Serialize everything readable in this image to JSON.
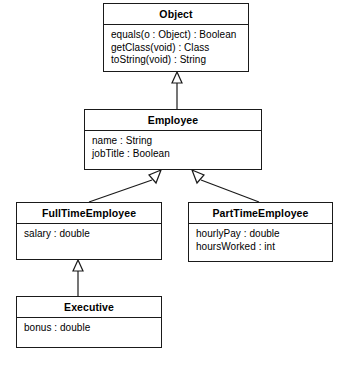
{
  "diagram": {
    "type": "uml-class-diagram",
    "background_color": "#ffffff",
    "line_color": "#1a1a1a",
    "text_color": "#000000",
    "classes": [
      {
        "id": "object",
        "name": "Object",
        "members": [
          "equals(o : Object) : Boolean",
          "getClass(void) : Class",
          "toString(void) : String"
        ],
        "x": 103,
        "y": 3,
        "width": 146,
        "height": 69
      },
      {
        "id": "employee",
        "name": "Employee",
        "members": [
          "name : String",
          "jobTitle : Boolean"
        ],
        "x": 84,
        "y": 109,
        "width": 178,
        "height": 61
      },
      {
        "id": "fulltimeemployee",
        "name": "FullTimeEmployee",
        "members": [
          "salary : double"
        ],
        "x": 16,
        "y": 202,
        "width": 146,
        "height": 58
      },
      {
        "id": "parttimeemployee",
        "name": "PartTimeEmployee",
        "members": [
          "hourlyPay : double",
          "hoursWorked : int"
        ],
        "x": 188,
        "y": 202,
        "width": 145,
        "height": 60
      },
      {
        "id": "executive",
        "name": "Executive",
        "members": [
          "bonus : double"
        ],
        "x": 16,
        "y": 296,
        "width": 146,
        "height": 52
      }
    ],
    "generalizations": [
      {
        "from": "employee",
        "to": "object",
        "relation": "inheritance"
      },
      {
        "from": "fulltimeemployee",
        "to": "employee",
        "relation": "inheritance"
      },
      {
        "from": "parttimeemployee",
        "to": "employee",
        "relation": "inheritance"
      },
      {
        "from": "executive",
        "to": "fulltimeemployee",
        "relation": "inheritance"
      }
    ]
  }
}
